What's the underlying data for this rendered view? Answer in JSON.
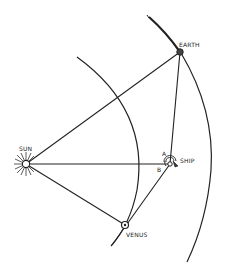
{
  "diagram": {
    "type": "orbital-geometry",
    "bodies": {
      "sun": {
        "label": "SUN",
        "x": 26,
        "y": 164
      },
      "earth": {
        "label": "EARTH",
        "x": 180,
        "y": 52
      },
      "ship": {
        "label": "SHIP",
        "x": 170,
        "y": 164
      },
      "venus": {
        "label": "VENUS",
        "x": 125,
        "y": 225
      }
    },
    "angles": {
      "a": {
        "label": "A"
      },
      "b": {
        "label": "B"
      }
    },
    "colors": {
      "ink": "#222222",
      "background": "#ffffff"
    }
  }
}
